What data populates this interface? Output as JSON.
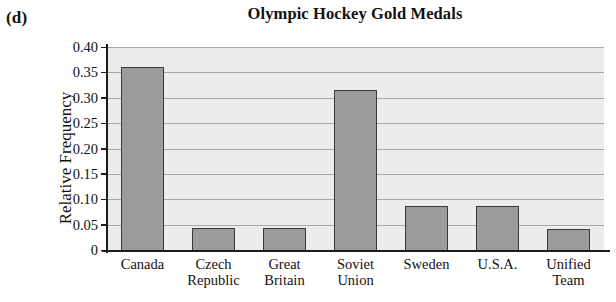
{
  "panel": {
    "label": "(d)"
  },
  "chart_data": {
    "type": "bar",
    "title": "Olympic Hockey Gold Medals",
    "xlabel": "",
    "ylabel": "Relative Frequency",
    "categories": [
      "Canada",
      "Czech Republic",
      "Great Britain",
      "Soviet Union",
      "Sweden",
      "U.S.A.",
      "Unified Team"
    ],
    "category_lines": [
      [
        "Canada"
      ],
      [
        "Czech",
        "Republic"
      ],
      [
        "Great",
        "Britain"
      ],
      [
        "Soviet",
        "Union"
      ],
      [
        "Sweden"
      ],
      [
        "U.S.A."
      ],
      [
        "Unified",
        "Team"
      ]
    ],
    "values": [
      0.36,
      0.044,
      0.044,
      0.315,
      0.087,
      0.087,
      0.042
    ],
    "ylim": [
      0,
      0.4
    ],
    "ytick_values": [
      0,
      0.05,
      0.1,
      0.15,
      0.2,
      0.25,
      0.3,
      0.35,
      0.4
    ],
    "ytick_labels": [
      "0",
      "0.05",
      "0.10",
      "0.15",
      "0.20",
      "0.25",
      "0.30",
      "0.35",
      "0.40"
    ],
    "grid": true,
    "legend": null,
    "colors": {
      "bar_fill": "#9b9b9b",
      "bar_edge": "#3a3a3a",
      "plot_background": "#ebebeb",
      "gridline": "#a8a8a8",
      "axis": "#1c1c1c",
      "text": "#111111"
    }
  }
}
